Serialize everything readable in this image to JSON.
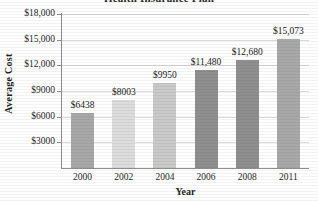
{
  "chart_data": {
    "type": "bar",
    "title": "Health Insurance Plan",
    "title_note": "title is cropped off the top edge of the screenshot",
    "xlabel": "Year",
    "ylabel": "Average Cost",
    "categories": [
      "2000",
      "2002",
      "2004",
      "2006",
      "2008",
      "2011"
    ],
    "values": [
      6438,
      8003,
      9950,
      11480,
      12680,
      15073
    ],
    "value_labels": [
      "$6438",
      "$8003",
      "$9950",
      "$11,480",
      "$12,680",
      "$15,073"
    ],
    "bar_colors": [
      "#a8a8a8",
      "#dcdcdc",
      "#c9c9c9",
      "#8f8f8f",
      "#8f8f8f",
      "#a8a8a8"
    ],
    "ylim": [
      0,
      18000
    ],
    "ytick_values": [
      3000,
      6000,
      9000,
      12000,
      15000,
      18000
    ],
    "ytick_labels": [
      "$3000",
      "$6000",
      "$9000",
      "$12,000",
      "$15,000",
      "$18,000"
    ],
    "grid": "horizontal",
    "legend": "none"
  },
  "axes": {
    "y_title": "Average Cost",
    "x_title": "Year"
  }
}
